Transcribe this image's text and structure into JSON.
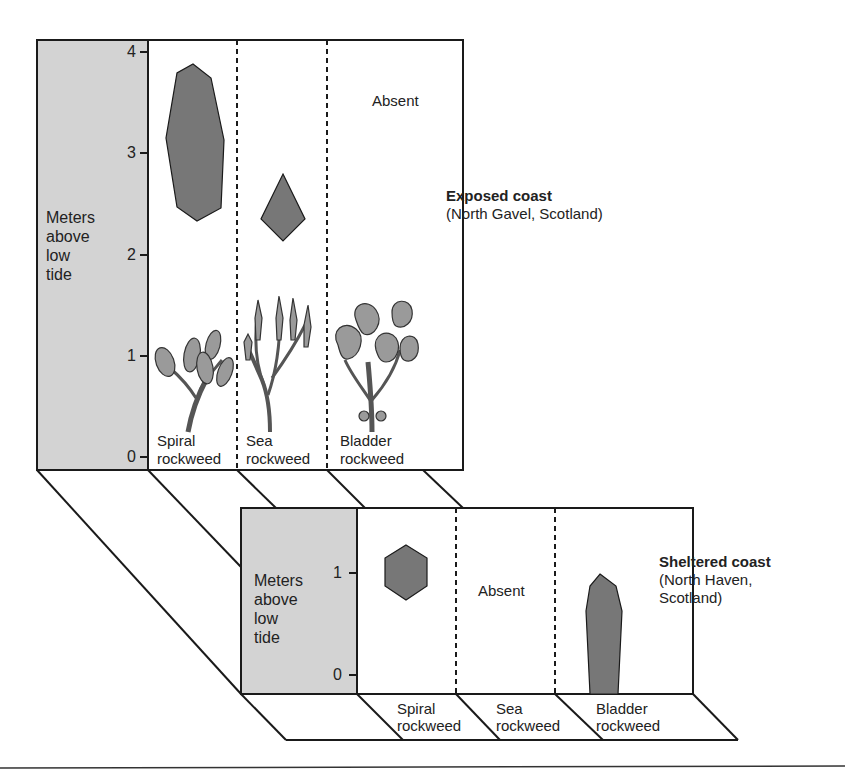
{
  "colors": {
    "axis_panel_fill": "#d3d3d3",
    "range_shape_fill": "#777777",
    "line": "#1a1a1a",
    "background": "#ffffff"
  },
  "exposed": {
    "title": "Exposed coast",
    "subtitle": "(North Gavel, Scotland)",
    "axis_label_lines": [
      "Meters",
      "above",
      "low",
      "tide"
    ],
    "ticks": [
      "4",
      "3",
      "2",
      "1",
      "0"
    ],
    "species": [
      {
        "line1": "Spiral",
        "line2": "rockweed",
        "range_m": [
          2.4,
          3.9
        ],
        "status": "present",
        "illustration": "spiral-rockweed-illustration"
      },
      {
        "line1": "Sea",
        "line2": "rockweed",
        "range_m": [
          2.2,
          2.8
        ],
        "status": "present",
        "illustration": "sea-rockweed-illustration"
      },
      {
        "line1": "Bladder",
        "line2": "rockweed",
        "range_m": null,
        "status": "Absent",
        "illustration": "bladder-rockweed-illustration"
      }
    ]
  },
  "sheltered": {
    "title": "Sheltered coast",
    "subtitle_lines": [
      "(North Haven,",
      "Scotland)"
    ],
    "axis_label_lines": [
      "Meters",
      "above",
      "low",
      "tide"
    ],
    "ticks": [
      "1",
      "0"
    ],
    "species": [
      {
        "line1": "Spiral",
        "line2": "rockweed",
        "range_m": [
          0.75,
          1.2
        ],
        "status": "present"
      },
      {
        "line1": "Sea",
        "line2": "rockweed",
        "range_m": null,
        "status": "Absent"
      },
      {
        "line1": "Bladder",
        "line2": "rockweed",
        "range_m": [
          0.0,
          0.95
        ],
        "status": "present"
      }
    ]
  }
}
